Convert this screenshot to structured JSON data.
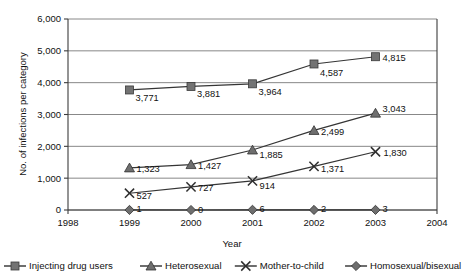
{
  "chart_data": {
    "type": "line",
    "title": "",
    "xlabel": "Year",
    "ylabel": "No. of infections per category",
    "x": [
      "1999",
      "2000",
      "2001",
      "2002",
      "2003"
    ],
    "xtick_labels": [
      "1998",
      "1999",
      "2000",
      "2001",
      "2002",
      "2003",
      "2004"
    ],
    "ytick_labels": [
      "0",
      "1,000",
      "2,000",
      "3,000",
      "4,000",
      "5,000",
      "6,000"
    ],
    "ylim": [
      0,
      6000
    ],
    "ytick_values": [
      0,
      1000,
      2000,
      3000,
      4000,
      5000,
      6000
    ],
    "grid": true,
    "legend_position": "bottom",
    "series": [
      {
        "name": "Injecting drug users",
        "marker": "square",
        "values": [
          3771,
          3881,
          3964,
          4587,
          4815
        ],
        "labels": [
          "3,771",
          "3,881",
          "3,964",
          "4,587",
          "4,815"
        ]
      },
      {
        "name": "Heterosexual",
        "marker": "triangle",
        "values": [
          1323,
          1427,
          1885,
          2499,
          3043
        ],
        "labels": [
          "1,323",
          "1,427",
          "1,885",
          "2,499",
          "3,043"
        ]
      },
      {
        "name": "Mother-to-child",
        "marker": "cross",
        "values": [
          527,
          727,
          914,
          1371,
          1830
        ],
        "labels": [
          "527",
          "727",
          "914",
          "1,371",
          "1,830"
        ]
      },
      {
        "name": "Homosexual/bisexual",
        "marker": "diamond",
        "values": [
          1,
          0,
          6,
          2,
          3
        ],
        "labels": [
          "1",
          "0",
          "6",
          "2",
          "3"
        ]
      }
    ]
  },
  "colors": {
    "series_line": "#353535",
    "gridline": "#7a7a7a",
    "axis": "#3c3c3c",
    "marker_fill": "#6e6e6e",
    "background": "#ffffff"
  }
}
